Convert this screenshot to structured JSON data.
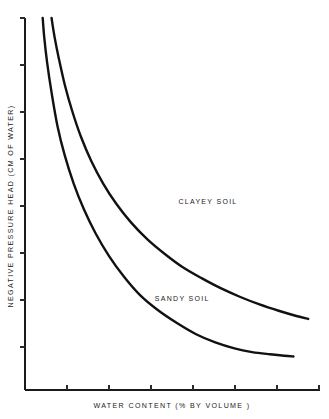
{
  "chart_data": {
    "type": "line",
    "title": "",
    "subtitle": "",
    "xlabel": "WATER CONTENT  (% BY VOLUME )",
    "ylabel": "NEGATIVE PRESSURE HEAD  (CM OF WATER)",
    "xlim": [
      0,
      100
    ],
    "ylim": [
      0,
      100
    ],
    "grid": false,
    "legend_position": "inline-annotation",
    "axis_tick_labels": {
      "x": [],
      "y": []
    },
    "x_tick_count": 7,
    "y_tick_count": 8,
    "annotations": [
      {
        "text": "CLAYEY SOIL",
        "x": 52,
        "y": 50
      },
      {
        "text": "SANDY SOIL",
        "x": 44,
        "y": 24
      }
    ],
    "series": [
      {
        "name": "SANDY SOIL",
        "color": "#111111",
        "x": [
          6,
          6.5,
          7.5,
          9,
          11,
          13.5,
          16.5,
          20,
          24,
          28.5,
          33.5,
          39,
          45,
          51.5,
          58,
          64.5,
          71,
          77,
          83,
          88,
          91
        ],
        "y": [
          100,
          95,
          88,
          80,
          71,
          63,
          55.5,
          48.5,
          42,
          36,
          30.5,
          25.5,
          21.5,
          18,
          15,
          12.8,
          11.2,
          10.2,
          9.6,
          9.2,
          9.0
        ]
      },
      {
        "name": "CLAYEY SOIL",
        "color": "#111111",
        "x": [
          9,
          10,
          11.5,
          13.5,
          16,
          19,
          22.5,
          26.5,
          31,
          36,
          41.5,
          47.5,
          53.5,
          60,
          66.5,
          73,
          79.5,
          86,
          92,
          96
        ],
        "y": [
          100,
          95,
          89,
          82,
          75,
          68,
          61.5,
          55.5,
          50,
          45,
          40.5,
          36.5,
          33,
          30,
          27.3,
          25,
          23,
          21.3,
          19.9,
          19.1
        ]
      }
    ]
  },
  "figure": {
    "caption": "",
    "background_color": "#ffffff",
    "ink_color": "#111111"
  }
}
